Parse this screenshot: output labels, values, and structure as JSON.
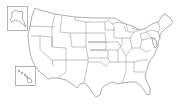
{
  "map": {
    "type": "us-states-outline",
    "background": "#ffffff",
    "stroke_color": "#4a4a4a",
    "insets": [
      {
        "name": "Alaska",
        "box": [
          7,
          6,
          21,
          25
        ]
      },
      {
        "name": "Hawaii",
        "box": [
          15,
          66,
          21,
          20
        ]
      }
    ],
    "labels": []
  }
}
